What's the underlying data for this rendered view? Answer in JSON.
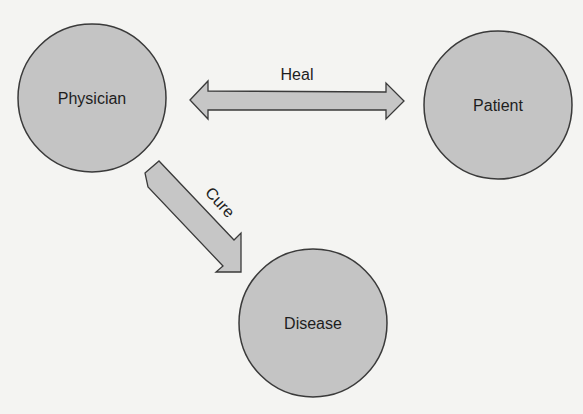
{
  "diagram": {
    "nodes": [
      {
        "id": "physician",
        "label": "Physician"
      },
      {
        "id": "patient",
        "label": "Patient"
      },
      {
        "id": "disease",
        "label": "Disease"
      }
    ],
    "edges": [
      {
        "from": "physician",
        "to": "patient",
        "label": "Heal",
        "style": "bidirectional"
      },
      {
        "from": "physician",
        "to": "disease",
        "label": "Cure",
        "style": "directed"
      }
    ],
    "colors": {
      "node_fill": "#c4c4c4",
      "node_stroke": "#3a3a3a",
      "arrow_fill": "#c6c6c6",
      "arrow_stroke": "#3a3a3a",
      "text": "#1e1e1e",
      "background": "#f4f4f2"
    }
  }
}
